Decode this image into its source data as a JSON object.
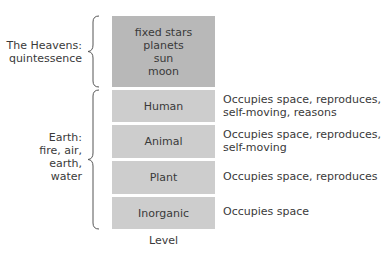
{
  "groups": [
    {
      "label_lines": [
        "The Heavens:",
        "quintessence"
      ],
      "levels": [
        {
          "lines": [
            "fixed stars",
            "planets",
            "sun",
            "moon"
          ],
          "description_lines": []
        }
      ]
    },
    {
      "label_lines": [
        "Earth:",
        "fire, air,",
        "earth,",
        "water"
      ],
      "levels": [
        {
          "lines": [
            "Human"
          ],
          "description_lines": [
            "Occupies space, reproduces,",
            "self-moving, reasons"
          ]
        },
        {
          "lines": [
            "Animal"
          ],
          "description_lines": [
            "Occupies space, reproduces,",
            "self-moving"
          ]
        },
        {
          "lines": [
            "Plant"
          ],
          "description_lines": [
            "Occupies space, reproduces"
          ]
        },
        {
          "lines": [
            "Inorganic"
          ],
          "description_lines": [
            "Occupies space"
          ]
        }
      ]
    }
  ],
  "axis": {
    "label": "Level"
  },
  "colors": {
    "heavens_box": "#b8b8b8",
    "earth_box": "#cdcdcd",
    "text": "#3a3a3a",
    "brace": "#555555"
  }
}
